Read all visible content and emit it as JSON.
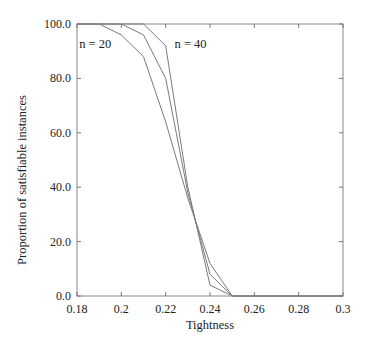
{
  "chart_data": {
    "type": "line",
    "title": "",
    "xlabel": "Tightness",
    "ylabel": "Proportion of satisfiable instances",
    "xlim": [
      0.18,
      0.3
    ],
    "ylim": [
      0.0,
      100.0
    ],
    "grid": false,
    "legend": "none (inline annotations)",
    "x_ticks": [
      "0.18",
      "0.2",
      "0.22",
      "0.24",
      "0.26",
      "0.28",
      "0.3"
    ],
    "y_ticks": [
      "0.0",
      "20.0",
      "40.0",
      "60.0",
      "80.0",
      "100.0"
    ],
    "x": [
      0.18,
      0.19,
      0.2,
      0.21,
      0.22,
      0.23,
      0.24,
      0.25,
      0.26,
      0.27,
      0.28,
      0.29,
      0.3
    ],
    "series": [
      {
        "name": "n = 20",
        "values": [
          100,
          100,
          96,
          88,
          64,
          36,
          12,
          0,
          0,
          0,
          0,
          0,
          0
        ]
      },
      {
        "name": "n = 30 (unlabeled middle curve)",
        "values": [
          100,
          100,
          100,
          96,
          80,
          38,
          8,
          0,
          0,
          0,
          0,
          0,
          0
        ]
      },
      {
        "name": "n = 40",
        "values": [
          100,
          100,
          100,
          100,
          92,
          40,
          4,
          0,
          0,
          0,
          0,
          0,
          0
        ]
      }
    ],
    "annotations": [
      {
        "text": "n = 20",
        "x": 0.181,
        "y": 91
      },
      {
        "text": "n = 40",
        "x": 0.224,
        "y": 91
      }
    ]
  },
  "style": {
    "line_color": "#7a7a7a",
    "frame_color": "#888888",
    "text_color": "#222222"
  }
}
